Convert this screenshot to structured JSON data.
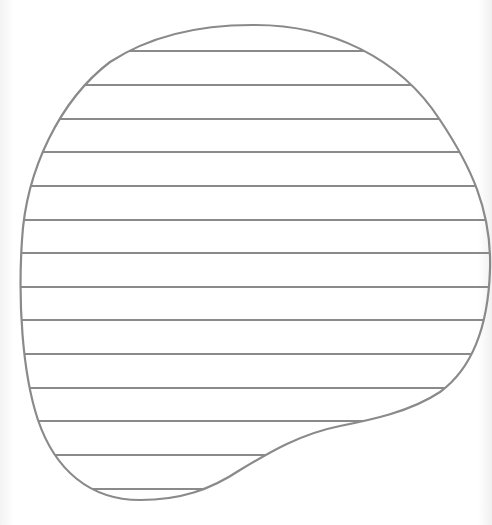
{
  "diagram": {
    "type": "hatched-blob",
    "stroke_color": "#8a8a8a",
    "background_color": "#ffffff",
    "hatch_line_count": 14,
    "hatch_lines_y": [
      51,
      85,
      119,
      152,
      186,
      220,
      253,
      287,
      320,
      354,
      388,
      421,
      455,
      489
    ]
  }
}
